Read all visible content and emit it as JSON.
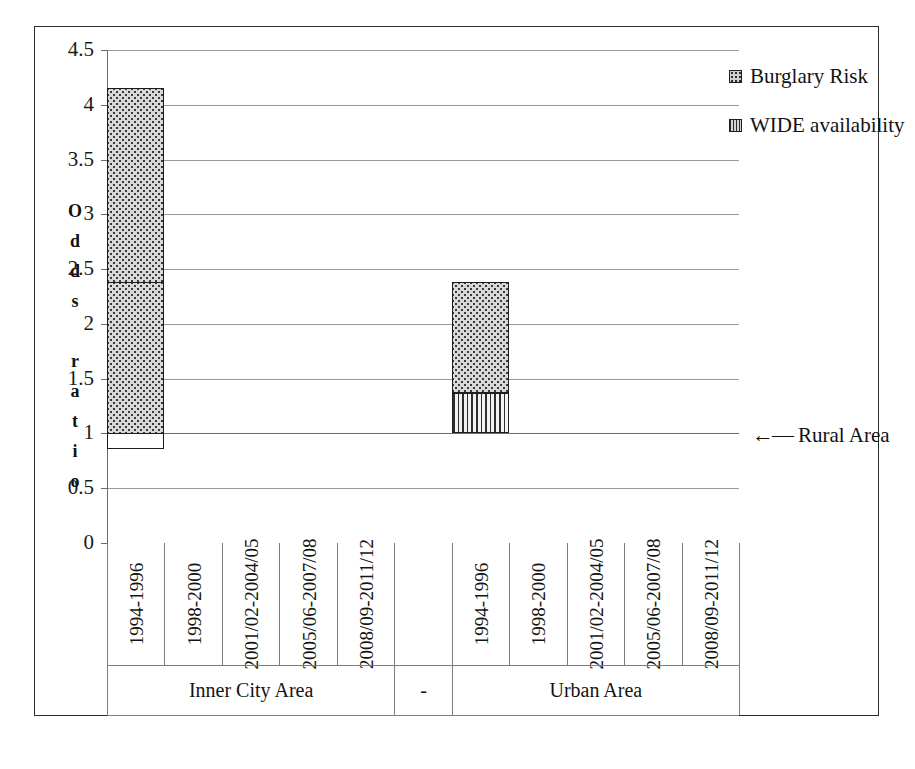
{
  "chart_data": {
    "type": "bar",
    "title": "",
    "subtitle": "",
    "xlabel": "",
    "ylabel": "Odds ratio",
    "ylim": [
      0,
      4.5
    ],
    "ytick_values": [
      0,
      0.5,
      1,
      1.5,
      2,
      2.5,
      3,
      3.5,
      4,
      4.5
    ],
    "ytick_labels": [
      "0",
      "0.5",
      "1",
      "1.5",
      "2",
      "2.5",
      "3",
      "3.5",
      "4",
      "4.5"
    ],
    "grid": true,
    "baseline": 1,
    "stacked": true,
    "legend_position": "top-right",
    "legend": [
      "Burglary Risk",
      "WIDE availability"
    ],
    "annotations": [
      {
        "text": "Rural Area",
        "arrow": "←",
        "at_value": 1
      }
    ],
    "groups": [
      {
        "name": "Inner City Area",
        "categories": [
          "1994-1996",
          "1998-2000",
          "2001/02-2004/05",
          "2005/06-2007/08",
          "2008/09-2011/12"
        ],
        "series": [
          {
            "name": "WIDE availability",
            "values": [
              1.45,
              null,
              null,
              1.09,
              null
            ]
          },
          {
            "name": "Burglary Risk",
            "values": [
              2.25,
              2.65,
              4.15,
              1.61,
              2.38
            ]
          }
        ],
        "wide_top": [
          1.45,
          2.04,
          1.76,
          1.09,
          0.86
        ],
        "risk_top": [
          2.25,
          2.65,
          4.15,
          1.61,
          2.38
        ]
      },
      {
        "name": "-",
        "categories": [],
        "series": [],
        "wide_top": [],
        "risk_top": []
      },
      {
        "name": "Urban Area",
        "categories": [
          "1994-1996",
          "1998-2000",
          "2001/02-2004/05",
          "2005/06-2007/08",
          "2008/09-2011/12"
        ],
        "series": [
          {
            "name": "WIDE availability",
            "values": [
              1.22,
              null,
              1.43,
              1.56,
              1.37
            ]
          },
          {
            "name": "Burglary Risk",
            "values": [
              1.48,
              1.99,
              1.56,
              1.56,
              2.38
            ]
          }
        ],
        "wide_top": [
          1.22,
          1.0,
          1.43,
          1.56,
          1.37
        ],
        "risk_top": [
          1.48,
          1.99,
          1.56,
          1.56,
          2.38
        ]
      }
    ]
  },
  "axis": {
    "y_title_chars": [
      "O",
      "d",
      "d",
      "s",
      "",
      "r",
      "a",
      "t",
      "i",
      "o"
    ],
    "ticks": [
      {
        "label": "4.5",
        "value": 4.5
      },
      {
        "label": "4",
        "value": 4
      },
      {
        "label": "3.5",
        "value": 3.5
      },
      {
        "label": "3",
        "value": 3
      },
      {
        "label": "2.5",
        "value": 2.5
      },
      {
        "label": "2",
        "value": 2
      },
      {
        "label": "1.5",
        "value": 1.5
      },
      {
        "label": "1",
        "value": 1
      },
      {
        "label": "0.5",
        "value": 0.5
      },
      {
        "label": "0",
        "value": 0
      }
    ]
  },
  "legend": {
    "items": [
      {
        "label": "Burglary Risk",
        "swatch": "risk",
        "color": "#cfcfcf"
      },
      {
        "label": "WIDE availability",
        "swatch": "wide",
        "color": "#8f8f8f"
      }
    ]
  },
  "annotation": {
    "arrow_glyph": "←—",
    "label": "Rural Area"
  },
  "categories_flat": [
    "1994-1996",
    "1998-2000",
    "2001/02-2004/05",
    "2005/06-2007/08",
    "2008/09-2011/12",
    "",
    "1994-1996",
    "1998-2000",
    "2001/02-2004/05",
    "2005/06-2007/08",
    "2008/09-2011/12"
  ],
  "group_labels": [
    "Inner City Area",
    "-",
    "Urban Area"
  ],
  "colors": {
    "frame": "#2b2b2b",
    "grid": "#9a9a9a",
    "bar_outline": "#1d1d1d",
    "risk_fill": "#d8d8d8",
    "wide_fill": "#e2e2e2",
    "text": "#111111"
  }
}
